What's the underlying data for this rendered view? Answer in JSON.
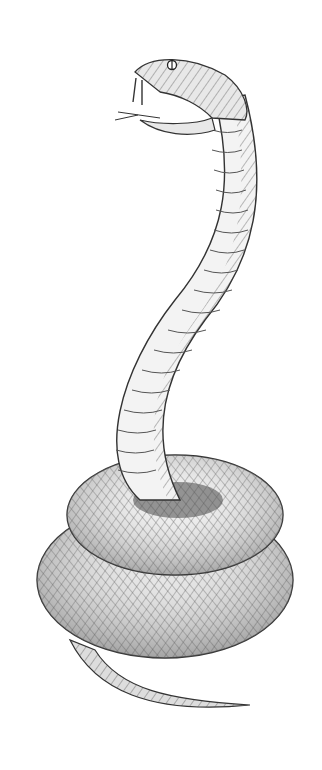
{
  "image": {
    "subject": "Pen-and-ink crosshatched illustration of a coiled snake with raised head and open mouth showing fangs and forked tongue",
    "style": "black ink crosshatching on white",
    "colors": {
      "background": "#ffffff",
      "ink": "#2a2a2a",
      "mid": "#7a7a7a",
      "light": "#bdbdbd"
    }
  }
}
